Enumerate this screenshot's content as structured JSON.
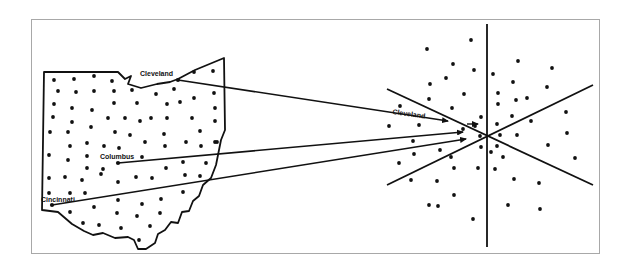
{
  "figure": {
    "colors": {
      "ink": "#111111",
      "frame": "#a8a8a8",
      "background": "#ffffff"
    }
  },
  "map": {
    "region": "Ohio",
    "labels": {
      "cleveland": "Cleveland",
      "columbus": "Columbus",
      "cincinnati": "Cincinnati"
    },
    "cities": [
      {
        "name": "Cleveland",
        "x": 178,
        "y": 80
      },
      {
        "name": "Columbus",
        "x": 118,
        "y": 163
      },
      {
        "name": "Cincinnati",
        "x": 52,
        "y": 205
      }
    ],
    "points": [
      [
        54,
        80
      ],
      [
        74,
        79
      ],
      [
        94,
        76
      ],
      [
        112,
        81
      ],
      [
        58,
        91
      ],
      [
        76,
        92
      ],
      [
        94,
        91
      ],
      [
        114,
        91
      ],
      [
        132,
        90
      ],
      [
        156,
        94
      ],
      [
        174,
        89
      ],
      [
        194,
        72
      ],
      [
        213,
        71
      ],
      [
        54,
        104
      ],
      [
        72,
        108
      ],
      [
        92,
        110
      ],
      [
        114,
        103
      ],
      [
        137,
        103
      ],
      [
        167,
        104
      ],
      [
        180,
        102
      ],
      [
        194,
        98
      ],
      [
        214,
        93
      ],
      [
        53,
        117
      ],
      [
        72,
        122
      ],
      [
        91,
        127
      ],
      [
        108,
        118
      ],
      [
        125,
        118
      ],
      [
        140,
        121
      ],
      [
        151,
        118
      ],
      [
        167,
        118
      ],
      [
        192,
        118
      ],
      [
        215,
        108
      ],
      [
        215,
        121
      ],
      [
        50,
        132
      ],
      [
        68,
        132
      ],
      [
        115,
        132
      ],
      [
        130,
        135
      ],
      [
        164,
        134
      ],
      [
        200,
        131
      ],
      [
        215,
        142
      ],
      [
        70,
        146
      ],
      [
        87,
        143
      ],
      [
        104,
        146
      ],
      [
        119,
        148
      ],
      [
        145,
        142
      ],
      [
        165,
        146
      ],
      [
        186,
        142
      ],
      [
        201,
        146
      ],
      [
        217,
        142
      ],
      [
        49,
        155
      ],
      [
        68,
        160
      ],
      [
        87,
        156
      ],
      [
        142,
        157
      ],
      [
        87,
        168
      ],
      [
        103,
        169
      ],
      [
        166,
        168
      ],
      [
        183,
        162
      ],
      [
        206,
        163
      ],
      [
        49,
        178
      ],
      [
        65,
        177
      ],
      [
        82,
        180
      ],
      [
        101,
        174
      ],
      [
        118,
        182
      ],
      [
        136,
        177
      ],
      [
        152,
        178
      ],
      [
        185,
        175
      ],
      [
        200,
        176
      ],
      [
        49,
        193
      ],
      [
        70,
        193
      ],
      [
        85,
        193
      ],
      [
        183,
        192
      ],
      [
        118,
        200
      ],
      [
        142,
        204
      ],
      [
        161,
        199
      ],
      [
        70,
        212
      ],
      [
        94,
        207
      ],
      [
        117,
        213
      ],
      [
        137,
        216
      ],
      [
        160,
        213
      ],
      [
        83,
        223
      ],
      [
        99,
        225
      ],
      [
        121,
        228
      ],
      [
        150,
        226
      ],
      [
        139,
        240
      ]
    ],
    "outline": "M44,72 L118,72 L125,79 L131,76 L128,84 L141,88 L157,84 L170,82 L178,79 L195,70 L224,58 L225,130 L221,140 L219,150 L216,165 L211,178 L203,185 L199,196 L193,201 L189,211 L182,212 L178,223 L171,222 L165,230 L158,234 L155,243 L146,249 L138,249 L134,240 L128,237 L115,238 L103,233 L93,235 L84,231 L72,224 L58,212 L42,210 Z"
  },
  "projection": {
    "center": {
      "x": 487,
      "y": 135
    },
    "axes": [
      {
        "x1": 487,
        "y1": 24,
        "x2": 487,
        "y2": 247
      },
      {
        "x1": 387,
        "y1": 89,
        "x2": 593,
        "y2": 185
      },
      {
        "x1": 387,
        "y1": 185,
        "x2": 593,
        "y2": 85
      }
    ],
    "label": "Cleveland",
    "label_pos": {
      "x": 407,
      "y": 116
    },
    "points": [
      [
        471,
        40
      ],
      [
        427,
        49
      ],
      [
        453,
        64
      ],
      [
        474,
        70
      ],
      [
        518,
        61
      ],
      [
        552,
        68
      ],
      [
        446,
        78
      ],
      [
        493,
        74
      ],
      [
        513,
        82
      ],
      [
        547,
        87
      ],
      [
        430,
        84
      ],
      [
        464,
        94
      ],
      [
        498,
        93
      ],
      [
        516,
        100
      ],
      [
        527,
        98
      ],
      [
        400,
        106
      ],
      [
        429,
        99
      ],
      [
        452,
        108
      ],
      [
        498,
        104
      ],
      [
        512,
        116
      ],
      [
        531,
        121
      ],
      [
        566,
        112
      ],
      [
        389,
        126
      ],
      [
        419,
        125
      ],
      [
        481,
        117
      ],
      [
        463,
        129
      ],
      [
        475,
        126
      ],
      [
        497,
        124
      ],
      [
        480,
        136
      ],
      [
        500,
        135
      ],
      [
        517,
        135
      ],
      [
        567,
        133
      ],
      [
        413,
        141
      ],
      [
        440,
        150
      ],
      [
        481,
        147
      ],
      [
        491,
        152
      ],
      [
        497,
        146
      ],
      [
        503,
        157
      ],
      [
        548,
        145
      ],
      [
        575,
        158
      ],
      [
        414,
        154
      ],
      [
        399,
        163
      ],
      [
        451,
        157
      ],
      [
        478,
        168
      ],
      [
        495,
        169
      ],
      [
        454,
        168
      ],
      [
        411,
        180
      ],
      [
        437,
        181
      ],
      [
        514,
        179
      ],
      [
        539,
        183
      ],
      [
        454,
        195
      ],
      [
        429,
        205
      ],
      [
        438,
        206
      ],
      [
        508,
        205
      ],
      [
        540,
        209
      ],
      [
        473,
        219
      ]
    ],
    "arrows": [
      {
        "from": [
          178,
          80
        ],
        "to": [
          448,
          121
        ]
      },
      {
        "from": [
          118,
          163
        ],
        "to": [
          463,
          132
        ]
      },
      {
        "from": [
          52,
          205
        ],
        "to": [
          466,
          139
        ]
      }
    ],
    "arrow_small": {
      "from": [
        467,
        124
      ],
      "to": [
        478,
        124
      ]
    }
  }
}
